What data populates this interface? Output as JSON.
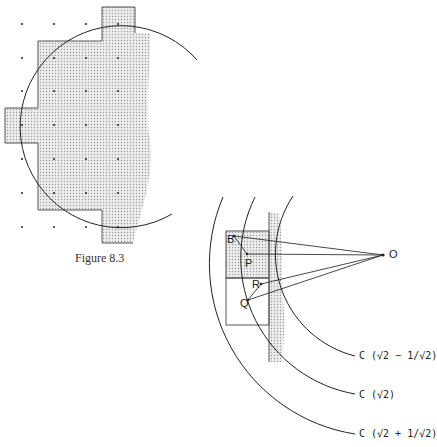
{
  "figure_left": {
    "caption": "Figure 8.3",
    "grid_dots": {
      "x": [
        22,
        54,
        86,
        118
      ],
      "y": [
        24,
        58,
        91,
        125,
        159,
        193,
        227
      ]
    },
    "circle": {
      "cx": 101,
      "cy": 125,
      "r": 101
    },
    "shade_color": "#d9d9d9",
    "outline_color": "#555555"
  },
  "figure_right": {
    "points": {
      "B": "B",
      "P": "P",
      "R": "R",
      "Q": "Q",
      "O": "O"
    },
    "arc_labels": {
      "inner": "C (√2 − 1/√2)",
      "middle": "C (√2)",
      "outer": "C (√2 + 1/√2)"
    }
  }
}
